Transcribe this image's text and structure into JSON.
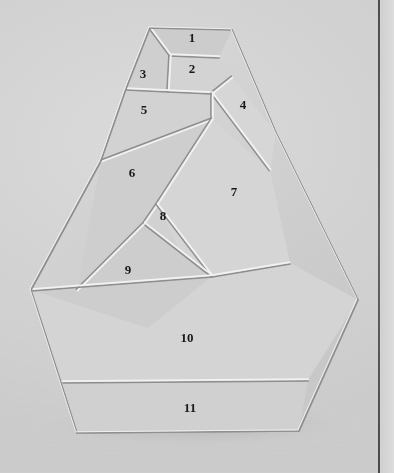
{
  "scene": {
    "title": "Eleven-piece polygon dissection puzzle",
    "description": "Photograph of a flat wooden/plastic dissection puzzle assembled into a tall pentagon-like silhouette, resting on a light gray surface and casting a soft shadow.",
    "background_color": "#d2d2d2",
    "piece_face_color": "#d0d0d0",
    "seam_highlight_color": "#f2f2f2",
    "seam_shadow_color": "#8e8e8e",
    "outline_color": "#9a9a9a",
    "shadow_color": "#bcbcbc",
    "border_line_color": "#4d4d4d",
    "label_color": "#1a1a1a",
    "right_margin_color": "#d8d8d8"
  },
  "pieces": [
    {
      "id": 1,
      "label": "1",
      "label_x": 192,
      "label_y": 42,
      "points": "150,28 232,30 219,57 170,55"
    },
    {
      "id": 2,
      "label": "2",
      "label_x": 192,
      "label_y": 73,
      "points": "170,55 219,57 232,77 212,93 168,91"
    },
    {
      "id": 3,
      "label": "3",
      "label_x": 143,
      "label_y": 78,
      "points": "150,28 170,55 168,91 126,89"
    },
    {
      "id": 4,
      "label": "4",
      "label_x": 243,
      "label_y": 109,
      "points": "232,77 276,133 270,170 212,93"
    },
    {
      "id": 5,
      "label": "5",
      "label_x": 144,
      "label_y": 114,
      "points": "126,89 168,91 212,93 212,119 101,161"
    },
    {
      "id": 6,
      "label": "6",
      "label_x": 132,
      "label_y": 177,
      "points": "101,161 212,119 157,204 144,223 77,290"
    },
    {
      "id": 7,
      "label": "7",
      "label_x": 234,
      "label_y": 196,
      "points": "212,119 270,170 290,263 212,276 183,258 157,204"
    },
    {
      "id": 8,
      "label": "8",
      "label_x": 163,
      "label_y": 220,
      "points": "157,204 183,258 212,276 144,223"
    },
    {
      "id": 9,
      "label": "9",
      "label_x": 128,
      "label_y": 274,
      "points": "77,290 144,223 212,276 148,328 31,290"
    },
    {
      "id": 10,
      "label": "10",
      "label_x": 187,
      "label_y": 342,
      "points": "31,290 148,328 212,276 290,263 358,300 308,380 63,382"
    },
    {
      "id": 11,
      "label": "11",
      "label_x": 190,
      "label_y": 412,
      "points": "63,382 308,380 299,431 77,433"
    }
  ],
  "seams": [
    {
      "name": "seam-1-2",
      "from_x": 170,
      "from_y": 55,
      "to_x": 219,
      "to_y": 57
    },
    {
      "name": "seam-1-3",
      "from_x": 150,
      "from_y": 28,
      "to_x": 170,
      "to_y": 55
    },
    {
      "name": "seam-2-3",
      "from_x": 170,
      "from_y": 55,
      "to_x": 168,
      "to_y": 91
    },
    {
      "name": "seam-2-4",
      "from_x": 232,
      "from_y": 77,
      "to_x": 212,
      "to_y": 93
    },
    {
      "name": "seam-3-5",
      "from_x": 126,
      "from_y": 89,
      "to_x": 168,
      "to_y": 91
    },
    {
      "name": "seam-2-5",
      "from_x": 168,
      "from_y": 91,
      "to_x": 212,
      "to_y": 93
    },
    {
      "name": "seam-4-7",
      "from_x": 212,
      "from_y": 93,
      "to_x": 270,
      "to_y": 170
    },
    {
      "name": "seam-5-7",
      "from_x": 212,
      "from_y": 93,
      "to_x": 212,
      "to_y": 119
    },
    {
      "name": "seam-5-6",
      "from_x": 212,
      "from_y": 119,
      "to_x": 101,
      "to_y": 161
    },
    {
      "name": "seam-6-7",
      "from_x": 212,
      "from_y": 119,
      "to_x": 157,
      "to_y": 204
    },
    {
      "name": "seam-6-8",
      "from_x": 157,
      "from_y": 204,
      "to_x": 144,
      "to_y": 223
    },
    {
      "name": "seam-7-8",
      "from_x": 157,
      "from_y": 204,
      "to_x": 212,
      "to_y": 276
    },
    {
      "name": "seam-8-9",
      "from_x": 144,
      "from_y": 223,
      "to_x": 212,
      "to_y": 276
    },
    {
      "name": "seam-6-9",
      "from_x": 144,
      "from_y": 223,
      "to_x": 77,
      "to_y": 290
    },
    {
      "name": "seam-9-10",
      "from_x": 31,
      "from_y": 290,
      "to_x": 212,
      "to_y": 276
    },
    {
      "name": "seam-7-10",
      "from_x": 212,
      "from_y": 276,
      "to_x": 290,
      "to_y": 263
    },
    {
      "name": "seam-10-11",
      "from_x": 63,
      "from_y": 382,
      "to_x": 308,
      "to_y": 380
    }
  ],
  "outline": "150,28 232,30 276,133 358,300 299,431 77,433 31,290 101,161 126,89",
  "shadow": {
    "cx": 196,
    "cy": 424,
    "rx": 172,
    "ry": 25
  },
  "counts": {
    "total_pieces": 11,
    "first_label": "1",
    "last_label": "11"
  }
}
